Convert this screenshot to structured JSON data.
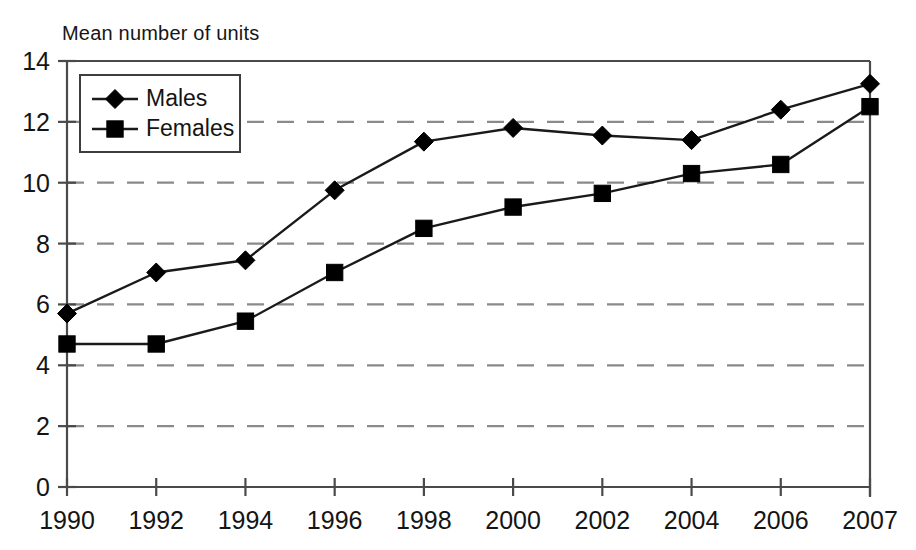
{
  "chart_data": {
    "type": "line",
    "title": "Mean number of units",
    "xlabel": "",
    "ylabel": "Mean number of units",
    "categories": [
      "1990",
      "1992",
      "1994",
      "1996",
      "1998",
      "2000",
      "2002",
      "2004",
      "2006",
      "2007"
    ],
    "x": [
      1990,
      1992,
      1994,
      1996,
      1998,
      2000,
      2002,
      2004,
      2006,
      2007
    ],
    "series": [
      {
        "name": "Males",
        "marker": "diamond",
        "values": [
          5.7,
          7.05,
          7.45,
          9.75,
          11.35,
          11.8,
          11.55,
          11.4,
          12.4,
          13.25
        ]
      },
      {
        "name": "Females",
        "marker": "square",
        "values": [
          4.7,
          4.7,
          5.45,
          7.05,
          8.5,
          9.2,
          9.65,
          10.3,
          10.6,
          12.5
        ]
      }
    ],
    "ylim": [
      0,
      14
    ],
    "yticks": [
      0,
      2,
      4,
      6,
      8,
      10,
      12,
      14
    ],
    "ytick_labels": [
      "0",
      "2",
      "4",
      "6",
      "8",
      "10",
      "12",
      "14"
    ],
    "xtick_labels": [
      "1990",
      "1992",
      "1994",
      "1996",
      "1998",
      "2000",
      "2002",
      "2004",
      "2006",
      "2007"
    ],
    "grid": true,
    "grid_style": "dashed-horizontal",
    "legend_position": "top-left-inside",
    "colors": {
      "line": "#1a1a1a",
      "marker": "#000000",
      "grid": "#8a8a8a",
      "axis": "#4a4a4a",
      "text": "#141414",
      "background": "#ffffff"
    }
  },
  "legend": {
    "entries": [
      {
        "label": "Males"
      },
      {
        "label": "Females"
      }
    ]
  }
}
